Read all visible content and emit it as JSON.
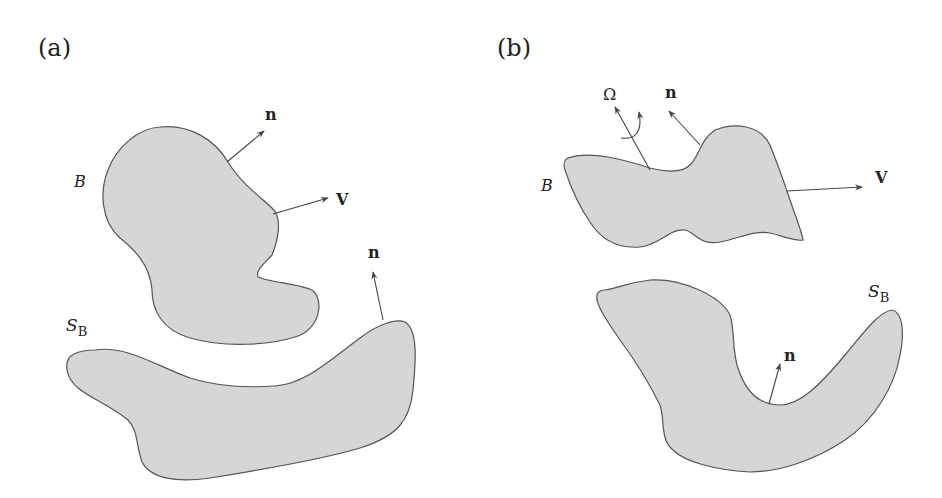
{
  "panels": [
    {
      "id": "a",
      "label": "(a)",
      "body_label": "B",
      "surface_label": "S",
      "surface_subscript": "B",
      "vectors": [
        {
          "name": "normal on body",
          "label": "n"
        },
        {
          "name": "velocity",
          "label": "V"
        },
        {
          "name": "normal on surface",
          "label": "n"
        }
      ]
    },
    {
      "id": "b",
      "label": "(b)",
      "body_label": "B",
      "surface_label": "S",
      "surface_subscript": "B",
      "vectors": [
        {
          "name": "angular velocity",
          "label": "Ω"
        },
        {
          "name": "normal on body",
          "label": "n"
        },
        {
          "name": "velocity",
          "label": "V"
        },
        {
          "name": "normal on surface",
          "label": "n"
        }
      ]
    }
  ],
  "colors": {
    "fill": "#d6d6d6",
    "stroke": "#555555",
    "text": "#222222"
  }
}
